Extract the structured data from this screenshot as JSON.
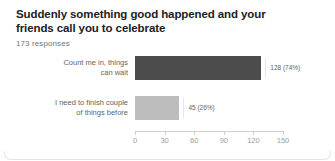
{
  "card": {
    "question_title": "Suddenly something good happened and your friends call you to celebrate",
    "responses_text": "173 responses"
  },
  "chart_data": {
    "type": "bar",
    "orientation": "horizontal",
    "title": "Suddenly something good happened and your friends call you to celebrate",
    "subtitle": "173 responses",
    "categories": [
      "Count me in, things can wait",
      "I need to finish couple of things before"
    ],
    "values": [
      128,
      45
    ],
    "percentages": [
      "74%",
      "26%"
    ],
    "data_labels": [
      "128 (74%)",
      "45 (26%)"
    ],
    "bar_colors": [
      "#4c4c4c",
      "#bdbdbd"
    ],
    "xlabel": "",
    "ylabel": "",
    "xlim": [
      0,
      150
    ],
    "xticks": [
      0,
      30,
      60,
      90,
      120,
      150
    ],
    "xtick_labels": [
      "0",
      "30",
      "60",
      "90",
      "120",
      "150"
    ],
    "grid": false,
    "legend": false,
    "total_responses": 173
  }
}
